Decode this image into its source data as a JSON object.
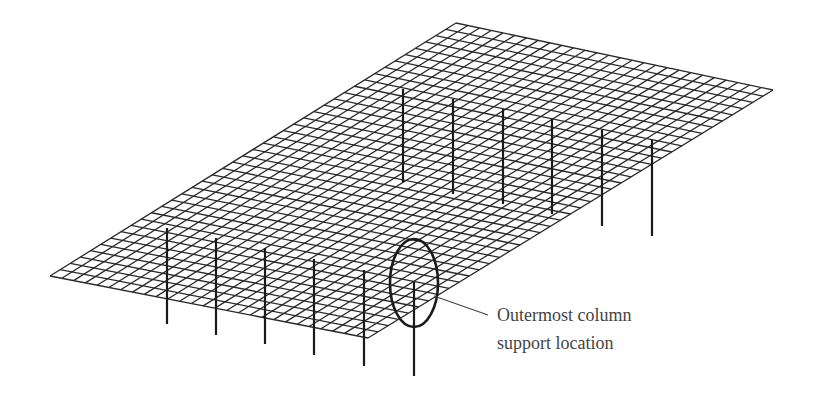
{
  "diagram": {
    "type": "isometric slab mesh with column supports",
    "slab": {
      "corners": {
        "top": [
          456,
          23
        ],
        "right": [
          773,
          90
        ],
        "bottom": [
          368,
          338
        ],
        "left": [
          50,
          276
        ]
      },
      "divisions_long": 40,
      "divisions_short": 27,
      "line_color": "#2a2a2a"
    },
    "columns_back_row": [
      {
        "x": 403,
        "top": 89,
        "bottom": 182
      },
      {
        "x": 453,
        "top": 99,
        "bottom": 194
      },
      {
        "x": 503,
        "top": 109,
        "bottom": 204
      },
      {
        "x": 552,
        "top": 119,
        "bottom": 214
      },
      {
        "x": 602,
        "top": 130,
        "bottom": 226
      },
      {
        "x": 652,
        "top": 140,
        "bottom": 236
      }
    ],
    "columns_front_row": [
      {
        "x": 167,
        "top": 228,
        "bottom": 324
      },
      {
        "x": 216,
        "top": 238,
        "bottom": 335
      },
      {
        "x": 265,
        "top": 248,
        "bottom": 344
      },
      {
        "x": 314,
        "top": 259,
        "bottom": 355
      },
      {
        "x": 364,
        "top": 270,
        "bottom": 366
      },
      {
        "x": 414,
        "top": 282,
        "bottom": 376
      }
    ],
    "highlight_ellipse": {
      "cx": 414,
      "cy": 283,
      "rx": 24,
      "ry": 44
    },
    "leader_line": {
      "x1": 434,
      "y1": 296,
      "x2": 488,
      "y2": 315
    },
    "annotation": {
      "line1": "Outermost column",
      "line2": "support location"
    }
  }
}
